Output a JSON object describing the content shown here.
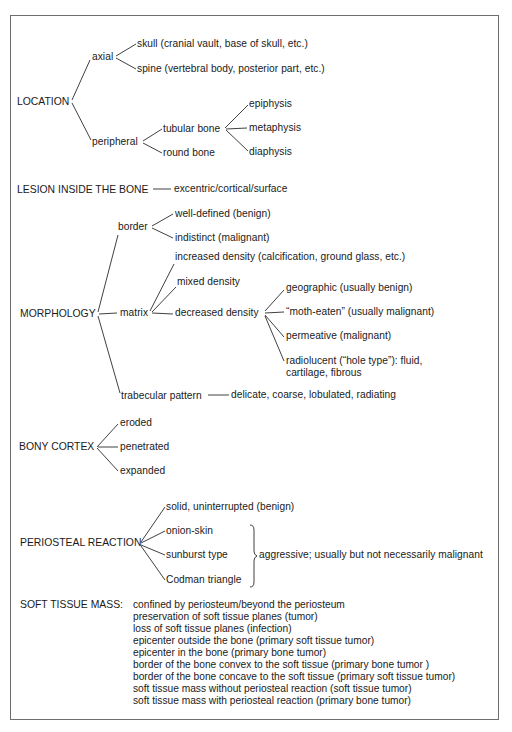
{
  "location": {
    "label": "LOCATION",
    "axial": {
      "label": "axial",
      "children": [
        "skull (cranial vault, base of skull, etc.)",
        "spine (vertebral body, posterior part, etc.)"
      ]
    },
    "peripheral": {
      "label": "peripheral",
      "tubular_bone": {
        "label": "tubular bone",
        "children": [
          "epiphysis",
          "metaphysis",
          "diaphysis"
        ]
      },
      "round_bone": "round bone"
    }
  },
  "lesion": {
    "label": "LESION INSIDE THE BONE",
    "value": "excentric/cortical/surface"
  },
  "morphology": {
    "label": "MORPHOLOGY",
    "border": {
      "label": "border",
      "children": [
        "well-defined (benign)",
        "indistinct (malignant)"
      ]
    },
    "matrix": {
      "label": "matrix",
      "increased": "increased density (calcification, ground glass, etc.)",
      "mixed": "mixed density",
      "decreased": {
        "label": "decreased density",
        "children": [
          "geographic (usually benign)",
          "“moth-eaten” (usually malignant)",
          "permeative (malignant)",
          "radiolucent (“hole type”): fluid,",
          "cartilage, fibrous"
        ]
      }
    },
    "trabecular": {
      "label": "trabecular pattern",
      "value": "delicate, coarse, lobulated, radiating"
    }
  },
  "bony_cortex": {
    "label": "BONY CORTEX",
    "children": [
      "eroded",
      "penetrated",
      "expanded"
    ]
  },
  "periosteal": {
    "label": "PERIOSTEAL REACTION",
    "children": [
      "solid, uninterrupted (benign)",
      "onion-skin",
      "sunburst type",
      "Codman triangle"
    ],
    "aggressive_note": "aggressive; usually but not necessarily malignant"
  },
  "soft_tissue": {
    "label": "SOFT TISSUE MASS:",
    "items": [
      "confined by periosteum/beyond the periosteum",
      "preservation of soft tissue planes (tumor)",
      "loss of soft tissue planes (infection)",
      "epicenter outside the bone (primary soft tissue tumor)",
      "epicenter in the bone (primary bone tumor)",
      "border of the bone convex to the soft tissue (primary bone tumor )",
      "border of the bone concave to the soft tissue (primary soft tissue tumor)",
      "soft tissue mass without periosteal reaction (soft tissue tumor)",
      "soft tissue mass with periosteal reaction (primary bone tumor)"
    ]
  }
}
